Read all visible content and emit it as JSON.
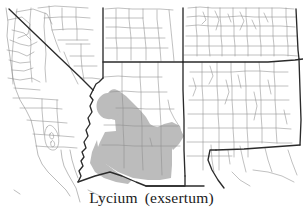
{
  "figure": {
    "caption": {
      "genus": "Lycium",
      "epithet": "(exsertum)",
      "full": "Lycium  (exsertum)"
    },
    "background_color": "#ffffff",
    "state_border_color": "#2b2b2b",
    "county_border_color": "#8a8a8a",
    "distribution_fill_color": "#bcbcbc",
    "caption_color": "#1a1a1a"
  },
  "map": {
    "type": "species-distribution-map",
    "region": "Southwestern United States",
    "states": [
      {
        "code": "CA",
        "name": "California"
      },
      {
        "code": "NV",
        "name": "Nevada"
      },
      {
        "code": "UT",
        "name": "Utah"
      },
      {
        "code": "CO",
        "name": "Colorado"
      },
      {
        "code": "AZ",
        "name": "Arizona"
      },
      {
        "code": "NM",
        "name": "New Mexico"
      }
    ],
    "distribution": {
      "label": "shaded range",
      "primary_state": "Arizona",
      "description": "southern and western Arizona"
    }
  }
}
